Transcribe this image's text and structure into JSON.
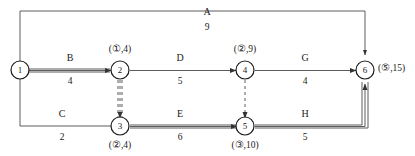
{
  "diagram": {
    "type": "activity-network-diagram",
    "title": "",
    "nodes": [
      {
        "id": "n1",
        "label": "1",
        "x": 20,
        "y": 70,
        "tag": "",
        "tag_circled": "",
        "tag_value": "",
        "tag_pos": ""
      },
      {
        "id": "n2",
        "label": "2",
        "x": 120,
        "y": 70,
        "tag": "(①,4)",
        "tag_circled": "1",
        "tag_value": "4",
        "tag_pos": "above"
      },
      {
        "id": "n3",
        "label": "3",
        "x": 120,
        "y": 126,
        "tag": "(②,4)",
        "tag_circled": "2",
        "tag_value": "4",
        "tag_pos": "below"
      },
      {
        "id": "n4",
        "label": "4",
        "x": 245,
        "y": 70,
        "tag": "(②,9)",
        "tag_circled": "2",
        "tag_value": "9",
        "tag_pos": "above"
      },
      {
        "id": "n5",
        "label": "5",
        "x": 245,
        "y": 126,
        "tag": "(③,10)",
        "tag_circled": "3",
        "tag_value": "10",
        "tag_pos": "below"
      },
      {
        "id": "n6",
        "label": "6",
        "x": 365,
        "y": 70,
        "tag": "(⑤,15)",
        "tag_circled": "5",
        "tag_value": "15",
        "tag_pos": "right"
      }
    ],
    "edges": [
      {
        "id": "A",
        "name": "A",
        "weight": "9",
        "from": "n1",
        "to": "n6",
        "style": "solid",
        "thick": false,
        "route": "top",
        "label_x": 207,
        "label_y": 12,
        "weight_x": 207,
        "weight_y": 28
      },
      {
        "id": "B",
        "name": "B",
        "weight": "4",
        "from": "n1",
        "to": "n2",
        "style": "solid",
        "thick": true,
        "route": "direct",
        "label_x": 70,
        "label_y": 58,
        "weight_x": 70,
        "weight_y": 82
      },
      {
        "id": "C",
        "name": "C",
        "weight": "2",
        "from": "n1",
        "to": "n3",
        "style": "solid",
        "thick": false,
        "route": "bottom",
        "label_x": 62,
        "label_y": 114,
        "weight_x": 62,
        "weight_y": 138
      },
      {
        "id": "D",
        "name": "D",
        "weight": "5",
        "from": "n2",
        "to": "n4",
        "style": "solid",
        "thick": false,
        "route": "direct",
        "label_x": 180,
        "label_y": 58,
        "weight_x": 180,
        "weight_y": 82
      },
      {
        "id": "E",
        "name": "E",
        "weight": "6",
        "from": "n3",
        "to": "n5",
        "style": "solid",
        "thick": true,
        "route": "direct",
        "label_x": 180,
        "label_y": 114,
        "weight_x": 180,
        "weight_y": 138
      },
      {
        "id": "G",
        "name": "G",
        "weight": "4",
        "from": "n4",
        "to": "n6",
        "style": "solid",
        "thick": false,
        "route": "direct",
        "label_x": 305,
        "label_y": 58,
        "weight_x": 305,
        "weight_y": 82
      },
      {
        "id": "H",
        "name": "H",
        "weight": "5",
        "from": "n5",
        "to": "n6",
        "style": "solid",
        "thick": true,
        "route": "bottom",
        "label_x": 305,
        "label_y": 114,
        "weight_x": 305,
        "weight_y": 138
      },
      {
        "id": "dummy-2-3",
        "name": "",
        "weight": "",
        "from": "n2",
        "to": "n3",
        "style": "dashed",
        "thick": true,
        "route": "vertical",
        "label_x": 0,
        "label_y": 0,
        "weight_x": 0,
        "weight_y": 0
      },
      {
        "id": "dummy-4-5",
        "name": "",
        "weight": "",
        "from": "n4",
        "to": "n5",
        "style": "dashed",
        "thick": false,
        "route": "vertical",
        "label_x": 0,
        "label_y": 0,
        "weight_x": 0,
        "weight_y": 0
      }
    ],
    "border": {
      "color": "#555555"
    },
    "colors": {
      "stroke": "#4d4d4d",
      "thick_stroke": "#555555",
      "text": "#1a1a1a"
    }
  }
}
